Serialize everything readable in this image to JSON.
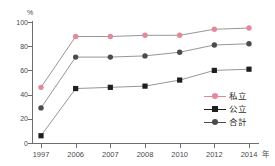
{
  "chart_data": {
    "type": "line",
    "title": "",
    "xlabel": "年",
    "ylabel": "%",
    "ylim": [
      0,
      100
    ],
    "grid": false,
    "legend_position": "inside-right",
    "categories": [
      "1997",
      "2006",
      "2007",
      "2008",
      "2010",
      "2012",
      "2014"
    ],
    "ytick_labels": [
      "0",
      "20",
      "40",
      "60",
      "80",
      "100"
    ],
    "yticks": [
      0,
      20,
      40,
      60,
      80,
      100
    ],
    "series": [
      {
        "name": "私立",
        "color": "#e2899c",
        "marker": "circle",
        "values": [
          46,
          88,
          88,
          89,
          89,
          94,
          95
        ]
      },
      {
        "name": "公立",
        "color": "#1f1f1f",
        "marker": "square",
        "values": [
          6,
          45,
          46,
          47,
          52,
          60,
          61
        ]
      },
      {
        "name": "合計",
        "color": "#4b4b4b",
        "marker": "circle",
        "values": [
          29,
          71,
          71,
          72,
          75,
          81,
          82
        ]
      }
    ]
  },
  "axis": {
    "unit_y": "%",
    "unit_x": "年"
  },
  "legend": {
    "items": [
      {
        "label": "私立"
      },
      {
        "label": "公立"
      },
      {
        "label": "合計"
      }
    ]
  },
  "colors": {
    "private": "#e2899c",
    "public": "#1f1f1f",
    "total": "#4b4b4b",
    "axis": "#6e6e6e",
    "line_connector": "#8a8a8a"
  }
}
